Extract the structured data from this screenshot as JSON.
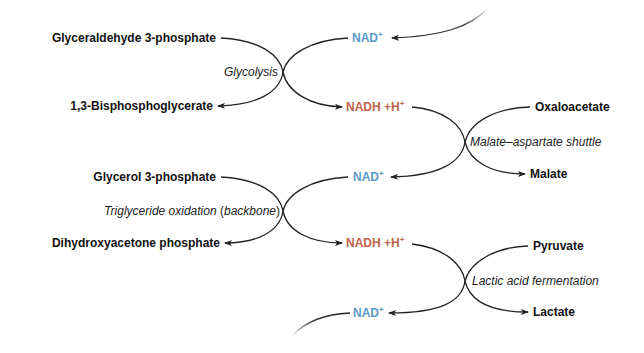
{
  "diagram": {
    "colors": {
      "line": "#222222",
      "text": "#111111",
      "nad": "#5a9ac7",
      "nadh": "#c0624a"
    },
    "reactions": [
      {
        "process": "Glycolysis",
        "substrate": "Glyceraldehyde 3-phosphate",
        "product": "1,3-Bisphosphoglycerate",
        "cofactor_in": "NAD",
        "cofactor_out": "NADH +H"
      },
      {
        "process": "Malate–aspartate shuttle",
        "substrate": "Oxaloacetate",
        "product": "Malate",
        "cofactor_in": "NADH +H",
        "cofactor_out": "NAD"
      },
      {
        "process_main": "Triglyceride oxidation",
        "process_paren_open": "(",
        "process_paren_word": "backbone",
        "process_paren_close": ")",
        "substrate": "Glycerol 3-phosphate",
        "product": "Dihydroxyacetone phosphate",
        "cofactor_in": "NAD",
        "cofactor_out": "NADH +H"
      },
      {
        "process": "Lactic acid fermentation",
        "substrate": "Pyruvate",
        "product": "Lactate",
        "cofactor_in": "NADH +H",
        "cofactor_out": "NAD"
      }
    ],
    "cofactors": {
      "nad_base": "NAD",
      "nadh_base": "NADH +H",
      "charge": "+"
    }
  }
}
